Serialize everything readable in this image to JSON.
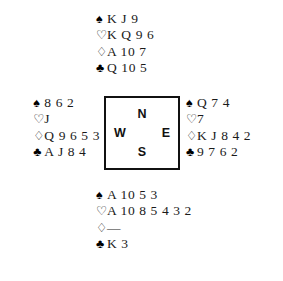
{
  "diagram": {
    "type": "bridge-deal",
    "background_color": "#ffffff",
    "text_color": "#1a1a1a",
    "border_color": "#111111"
  },
  "suits": {
    "spade": {
      "name": "spade-pip",
      "glyph": "♠",
      "style": "filled"
    },
    "heart": {
      "name": "heart-pip",
      "glyph": "♡",
      "style": "hollow"
    },
    "diamond": {
      "name": "diamond-pip",
      "glyph": "♢",
      "style": "hollow"
    },
    "club": {
      "name": "club-pip",
      "glyph": "♣",
      "style": "filled"
    }
  },
  "compass": {
    "north": "N",
    "east": "E",
    "south": "S",
    "west": "W"
  },
  "hands": {
    "north": {
      "spades": "K J 9",
      "hearts": "K Q 9 6",
      "diamonds": "A 10 7",
      "clubs": "Q 10 5"
    },
    "west": {
      "spades": "8 6 2",
      "hearts": "J",
      "diamonds": "Q 9 6 5 3",
      "clubs": "A J 8 4"
    },
    "east": {
      "spades": "Q 7 4",
      "hearts": "7",
      "diamonds": "K J 8 4 2",
      "clubs": "9 7 6 2"
    },
    "south": {
      "spades": "A 10 5 3",
      "hearts": "A 10 8 5 4 3 2",
      "diamonds": "—",
      "clubs": "K 3"
    }
  }
}
